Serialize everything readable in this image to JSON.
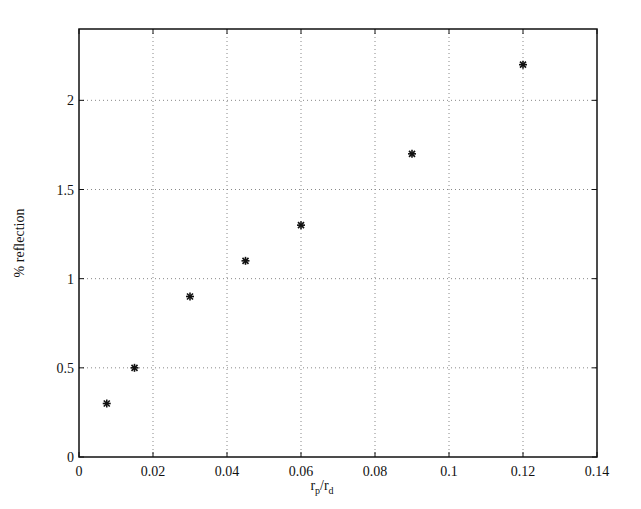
{
  "chart_data": {
    "type": "scatter",
    "title": "",
    "xlabel": "r_p/r_d",
    "xlabel_main": "r",
    "xlabel_sub1": "p",
    "xlabel_sep": "/r",
    "xlabel_sub2": "d",
    "ylabel": "% reflection",
    "xlim": [
      0,
      0.14
    ],
    "ylim": [
      0,
      2.4
    ],
    "xticks": [
      0,
      0.02,
      0.04,
      0.06,
      0.08,
      0.1,
      0.12,
      0.14
    ],
    "xtick_labels": [
      "0",
      "0.02",
      "0.04",
      "0.06",
      "0.08",
      "0.1",
      "0.12",
      "0.14"
    ],
    "yticks": [
      0,
      0.5,
      1,
      1.5,
      2
    ],
    "ytick_labels": [
      "0",
      "0.5",
      "1",
      "1.5",
      "2"
    ],
    "grid": true,
    "grid_style": "dotted",
    "marker": "*",
    "legend": null,
    "series": [
      {
        "name": "% reflection",
        "x": [
          0.0075,
          0.015,
          0.03,
          0.045,
          0.06,
          0.09,
          0.12
        ],
        "y": [
          0.3,
          0.5,
          0.9,
          1.1,
          1.3,
          1.7,
          2.2
        ]
      }
    ]
  },
  "colors": {
    "axis": "#111111",
    "grid": "#888888",
    "marker": "#111111",
    "background": "#ffffff"
  }
}
